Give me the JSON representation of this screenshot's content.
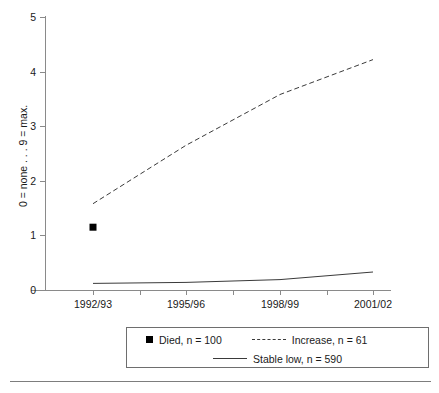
{
  "chart_data": {
    "type": "line",
    "title": "",
    "subtitle": "",
    "xlabel": "",
    "ylabel": "0 = none . . . 9 = max.",
    "categories": [
      "1992/93",
      "1995/96",
      "1998/99",
      "2001/02"
    ],
    "x_tick_labels": [
      "1992/93",
      "1995/96",
      "1998/99",
      "2001/02"
    ],
    "y_tick_labels": [
      "0",
      "1",
      "2",
      "3",
      "4",
      "5"
    ],
    "ylim": [
      0,
      5
    ],
    "y_tick_step": 1,
    "grid": false,
    "legend_position": "bottom",
    "series": [
      {
        "name": "Died, n = 100",
        "style": "marker-only",
        "marker": "square",
        "color": "#000000",
        "x": [
          "1992/93"
        ],
        "values": [
          1.15
        ]
      },
      {
        "name": "Increase, n = 61",
        "style": "dashed",
        "color": "#3a3a3a",
        "x": [
          "1992/93",
          "1995/96",
          "1998/99",
          "2001/02"
        ],
        "values": [
          1.58,
          2.65,
          3.58,
          4.22
        ]
      },
      {
        "name": "Stable low, n = 590",
        "style": "solid",
        "color": "#3a3a3a",
        "x": [
          "1992/93",
          "1995/96",
          "1998/99",
          "2001/02"
        ],
        "values": [
          0.12,
          0.14,
          0.19,
          0.33
        ]
      }
    ],
    "annotations": []
  },
  "axes": {
    "y_title": "0 = none . . . 9 = max.",
    "y_ticks": [
      {
        "label": "5",
        "value": 5
      },
      {
        "label": "4",
        "value": 4
      },
      {
        "label": "3",
        "value": 3
      },
      {
        "label": "2",
        "value": 2
      },
      {
        "label": "1",
        "value": 1
      },
      {
        "label": "0",
        "value": 0
      }
    ],
    "x_ticks": [
      {
        "label": "1992/93"
      },
      {
        "label": "1995/96"
      },
      {
        "label": "1998/99"
      },
      {
        "label": "2001/02"
      }
    ]
  },
  "legend": {
    "items": [
      {
        "label": "Died, n = 100",
        "marker": "square"
      },
      {
        "label": "Increase, n = 61",
        "marker": "dashed-line"
      },
      {
        "label": "Stable low, n = 590",
        "marker": "solid-line"
      }
    ]
  },
  "colors": {
    "axis": "#8a8a8a",
    "series_dashed": "#3a3a3a",
    "series_solid": "#3a3a3a",
    "marker": "#000000",
    "legend_border": "#6e6e6e",
    "rule": "#7d7d7d"
  }
}
